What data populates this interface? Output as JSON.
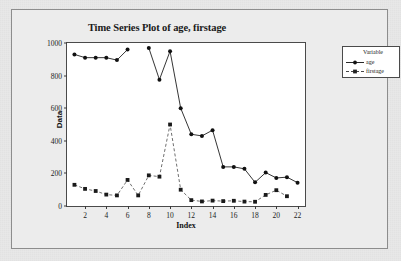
{
  "chart_data": {
    "type": "line",
    "title": "Time Series Plot of age, firstage",
    "xlabel": "Index",
    "ylabel": "Data",
    "xlim": [
      0.3,
      22.7
    ],
    "ylim": [
      0,
      1000
    ],
    "xticks": [
      2,
      4,
      6,
      8,
      10,
      12,
      14,
      16,
      18,
      20,
      22
    ],
    "yticks": [
      0,
      200,
      400,
      600,
      800,
      1000
    ],
    "grid": false,
    "legend_position": "right",
    "legend_title": "Variable",
    "x": [
      1,
      2,
      3,
      4,
      5,
      6,
      7,
      8,
      9,
      10,
      11,
      12,
      13,
      14,
      15,
      16,
      17,
      18,
      19,
      20,
      21,
      22
    ],
    "series": [
      {
        "name": "age",
        "color": "#111111",
        "linestyle": "solid",
        "marker": "circle",
        "values": [
          930,
          910,
          910,
          910,
          895,
          960,
          null,
          970,
          775,
          950,
          600,
          440,
          430,
          465,
          240,
          240,
          228,
          145,
          205,
          172,
          177,
          143
        ]
      },
      {
        "name": "firstage",
        "color": "#555555",
        "linestyle": "dashed",
        "marker": "square",
        "values": [
          130,
          105,
          92,
          70,
          65,
          160,
          65,
          188,
          180,
          500,
          100,
          36,
          28,
          33,
          30,
          32,
          27,
          26,
          68,
          97,
          60,
          null
        ]
      }
    ]
  }
}
